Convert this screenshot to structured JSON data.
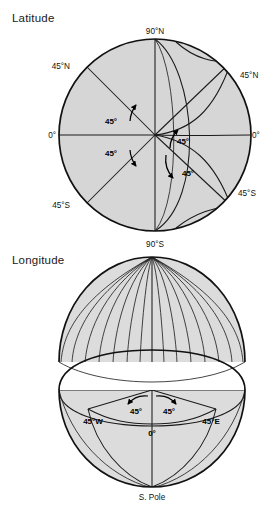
{
  "figure": {
    "domain": "Diagram",
    "background": "#ffffff",
    "globe_fill": "#d6d6d6",
    "line_color": "#111111",
    "text_color": "#111111",
    "width": 273,
    "height": 515
  },
  "latitude_figure": {
    "title": "Latitude",
    "center": {
      "x": 155,
      "y": 135
    },
    "radius": 96,
    "labels": {
      "north_pole": "90°N",
      "south_pole": "90°S",
      "upper_left": "45°N",
      "upper_right": "45°N",
      "left_equator": "0°",
      "right_equator": "0°",
      "lower_left": "45°S",
      "lower_right": "45°S"
    },
    "angle_labels": [
      {
        "id": "upper-left-angle",
        "text": "45°",
        "x": 111,
        "y": 121
      },
      {
        "id": "lower-left-angle",
        "text": "45°",
        "x": 111,
        "y": 153
      },
      {
        "id": "upper-right-angle",
        "text": "45°",
        "x": 180,
        "y": 141
      },
      {
        "id": "lower-right-angle",
        "text": "45°",
        "x": 185,
        "y": 173
      }
    ],
    "graticule": {
      "parallels": [
        "45°N",
        "0°",
        "45°S"
      ],
      "radii_degrees": [
        90,
        45,
        0,
        -45,
        -90
      ]
    }
  },
  "longitude_figure": {
    "title": "Longitude",
    "upper_dome": {
      "apex": {
        "x": 152,
        "y": 257
      },
      "half_width": 93,
      "base_y": 362,
      "meridian_count": 16
    },
    "lower_hemisphere": {
      "center": {
        "x": 152,
        "y": 390
      },
      "half_width": 93,
      "bottom_y": 487
    },
    "labels": {
      "west": "45°W",
      "east": "45°E",
      "prime_meridian": "0°",
      "south_pole": "S. Pole",
      "angle_left": "45°",
      "angle_right": "45°"
    }
  },
  "footer": {
    "cropped_text": ""
  }
}
